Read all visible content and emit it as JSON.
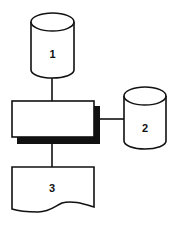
{
  "diagram": {
    "type": "flowchart",
    "nodes": [
      {
        "id": "1",
        "shape": "cylinder",
        "label": "1"
      },
      {
        "id": "process",
        "shape": "rectangle",
        "label": ""
      },
      {
        "id": "2",
        "shape": "cylinder",
        "label": "2"
      },
      {
        "id": "3",
        "shape": "document",
        "label": "3"
      }
    ],
    "edges": [
      {
        "from": "1",
        "to": "process"
      },
      {
        "from": "process",
        "to": "2"
      },
      {
        "from": "process",
        "to": "3"
      }
    ],
    "colors": {
      "stroke": "#111111",
      "fill": "#ffffff"
    }
  }
}
